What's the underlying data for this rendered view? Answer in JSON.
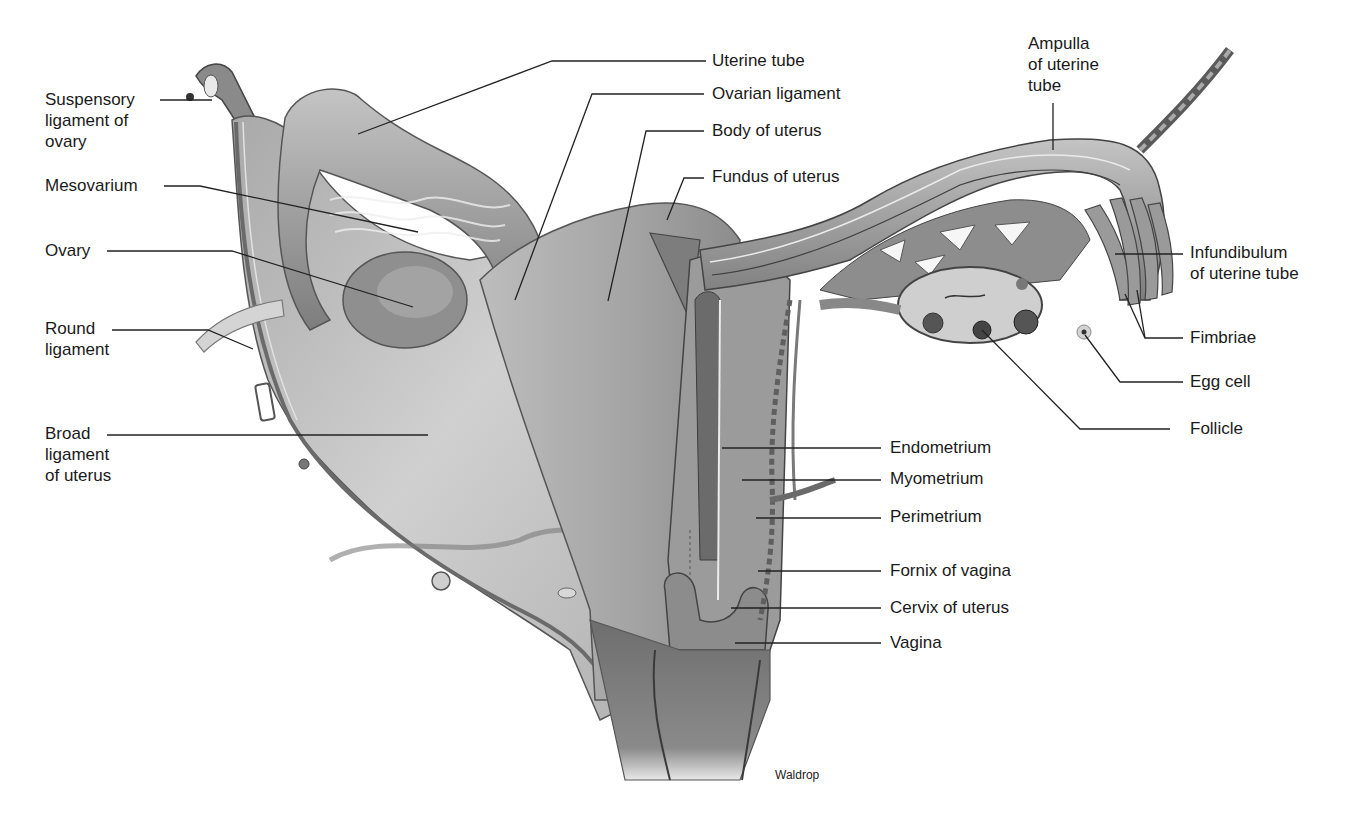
{
  "figure": {
    "type": "anatomical illustration",
    "credit": "Waldrop"
  },
  "labels": {
    "suspensory_ligament": "Suspensory\nligament of\novary",
    "mesovarium": "Mesovarium",
    "ovary": "Ovary",
    "round_ligament": "Round\nligament",
    "broad_ligament": "Broad\nligament\nof uterus",
    "uterine_tube": "Uterine tube",
    "ovarian_ligament": "Ovarian ligament",
    "body_of_uterus": "Body of uterus",
    "fundus_of_uterus": "Fundus of uterus",
    "ampulla": "Ampulla\nof uterine\ntube",
    "infundibulum": "Infundibulum\nof uterine tube",
    "fimbriae": "Fimbriae",
    "egg_cell": "Egg cell",
    "follicle": "Follicle",
    "endometrium": "Endometrium",
    "myometrium": "Myometrium",
    "perimetrium": "Perimetrium",
    "fornix_of_vagina": "Fornix of vagina",
    "cervix_of_uterus": "Cervix of uterus",
    "vagina": "Vagina"
  },
  "colors": {
    "background": "#ffffff",
    "label_text": "#1a1a1a",
    "leader_line": "#222222",
    "tissue_light": "#c8c8c8",
    "tissue_mid": "#9a9a9a",
    "tissue_dark": "#5a5a5a"
  }
}
